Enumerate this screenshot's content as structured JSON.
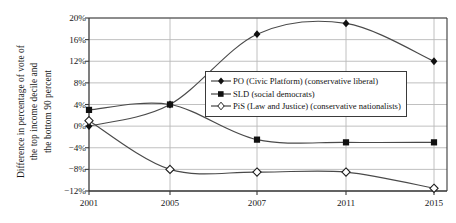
{
  "chart_data": {
    "type": "line",
    "title": "",
    "xlabel": "",
    "ylabel": "Difference in percentage of vote of the top income decile and the bottom 90 percent",
    "ylabel_lines": [
      "Difference in percentage of vote of",
      "the top income decile and",
      "the bottom 90 percent"
    ],
    "categories": [
      "2001",
      "2005",
      "2007",
      "2011",
      "2015"
    ],
    "ytick_labels": [
      "20%",
      "16%",
      "12%",
      "8%",
      "4%",
      "0%",
      "−4%",
      "−8%",
      "−12%"
    ],
    "ytick_values": [
      20,
      16,
      12,
      8,
      4,
      0,
      -4,
      -8,
      -12
    ],
    "ylim": [
      -12,
      20
    ],
    "grid": true,
    "legend_position": "center-right",
    "series": [
      {
        "name": "PO (Civic Platform) (conservative liberal)",
        "marker": "filled-diamond",
        "values": [
          0,
          4,
          17,
          19,
          12
        ]
      },
      {
        "name": "SLD (social democrats)",
        "marker": "filled-square",
        "values": [
          3,
          4,
          -2.5,
          -3,
          -3
        ]
      },
      {
        "name": "PiS (Law and Justice) (conservative nationalists)",
        "marker": "open-diamond",
        "values": [
          1,
          -8,
          -8.5,
          -8.5,
          -11.5
        ]
      }
    ]
  },
  "legend": {
    "items": [
      {
        "label": "PO (Civic Platform) (conservative liberal)",
        "marker": "filled-diamond"
      },
      {
        "label": "SLD (social democrats)",
        "marker": "filled-square"
      },
      {
        "label": "PiS (Law and Justice) (conservative nationalists)",
        "marker": "open-diamond"
      }
    ]
  },
  "colors": {
    "line": "#4a4a4a",
    "marker": "#111111",
    "grid": "#b9b9b9",
    "axis": "#3a3a3a",
    "text": "#171717",
    "background": "#ffffff"
  }
}
